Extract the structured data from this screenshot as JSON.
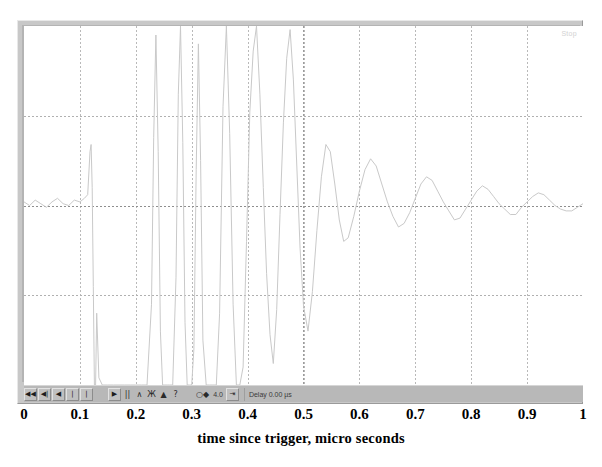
{
  "figure": {
    "instrument": "digital-storage-oscilloscope",
    "scope_readout": "Stop"
  },
  "toolbar": {
    "buttons": [
      {
        "name": "skip-back-button",
        "glyph": "◀◀",
        "style": "btn"
      },
      {
        "name": "step-back-button",
        "glyph": "◀|",
        "style": "btn"
      },
      {
        "name": "play-left-button",
        "glyph": "◀",
        "style": "btn"
      },
      {
        "name": "marker-a-button",
        "glyph": "|",
        "style": "btn"
      },
      {
        "name": "marker-b-button",
        "glyph": "|",
        "style": "btn"
      }
    ],
    "center_buttons": [
      {
        "name": "step-forward-button",
        "glyph": "▶",
        "style": "btn"
      },
      {
        "name": "pause-button",
        "glyph": "||",
        "style": "flat"
      },
      {
        "name": "rising-edge-icon",
        "glyph": "∧",
        "style": "flat"
      },
      {
        "name": "trigger-mode-icon",
        "glyph": "Ж",
        "style": "flat"
      },
      {
        "name": "trigger-level-icon",
        "glyph": "▲",
        "style": "flat"
      },
      {
        "name": "help-icon",
        "glyph": "?",
        "style": "flat"
      }
    ],
    "right_buttons": [
      {
        "name": "cursor-pair-icon",
        "glyph": "○◆",
        "style": "flat"
      }
    ],
    "scale_value": "4.0",
    "zoom-icon": "⇥",
    "delay_label": "Delay  0.00 µs"
  },
  "chart_data": {
    "type": "line",
    "title": "",
    "xlabel": "time since trigger, micro seconds",
    "ylabel": "",
    "xlim": [
      0,
      1
    ],
    "ylim": [
      -1,
      1
    ],
    "grid": true,
    "grid_divisions_x": 10,
    "grid_divisions_y": 4,
    "legend": "none",
    "xtick_labels": [
      "0",
      "0.1",
      "0.2",
      "0.3",
      "0.4",
      "0.5",
      "0.6",
      "0.7",
      "0.8",
      "0.9",
      "1"
    ],
    "xtick_values": [
      0,
      0.1,
      0.2,
      0.3,
      0.4,
      0.5,
      0.6,
      0.7,
      0.8,
      0.9,
      1.0
    ],
    "ytick_labels": [],
    "trace_color": "#c9c9c9",
    "series": [
      {
        "name": "channel-1-voltage",
        "description": "flat pre-trigger baseline, abrupt switching transient with full-scale excursions between 0.12 and 0.40 us, damped ringing 0.40-0.58 us, then decaying low-amplitude noise to 1.0 us",
        "x": [
          0.0,
          0.01,
          0.02,
          0.03,
          0.04,
          0.05,
          0.06,
          0.07,
          0.08,
          0.09,
          0.1,
          0.108,
          0.114,
          0.118,
          0.12,
          0.122,
          0.124,
          0.126,
          0.128,
          0.13,
          0.134,
          0.14,
          0.15,
          0.16,
          0.17,
          0.18,
          0.19,
          0.2,
          0.21,
          0.22,
          0.228,
          0.232,
          0.236,
          0.24,
          0.244,
          0.248,
          0.252,
          0.256,
          0.26,
          0.266,
          0.272,
          0.276,
          0.28,
          0.284,
          0.288,
          0.292,
          0.296,
          0.3,
          0.304,
          0.308,
          0.312,
          0.316,
          0.32,
          0.326,
          0.332,
          0.338,
          0.344,
          0.35,
          0.356,
          0.362,
          0.368,
          0.374,
          0.38,
          0.386,
          0.392,
          0.398,
          0.404,
          0.41,
          0.416,
          0.422,
          0.428,
          0.434,
          0.44,
          0.446,
          0.452,
          0.458,
          0.464,
          0.47,
          0.476,
          0.482,
          0.488,
          0.494,
          0.5,
          0.508,
          0.516,
          0.524,
          0.532,
          0.54,
          0.548,
          0.556,
          0.564,
          0.572,
          0.58,
          0.59,
          0.6,
          0.61,
          0.62,
          0.63,
          0.64,
          0.65,
          0.66,
          0.67,
          0.68,
          0.69,
          0.7,
          0.71,
          0.72,
          0.73,
          0.74,
          0.75,
          0.76,
          0.77,
          0.78,
          0.79,
          0.8,
          0.81,
          0.82,
          0.83,
          0.84,
          0.85,
          0.86,
          0.87,
          0.88,
          0.89,
          0.9,
          0.91,
          0.92,
          0.93,
          0.94,
          0.95,
          0.96,
          0.97,
          0.98,
          0.99,
          1.0
        ],
        "y": [
          0.02,
          0.0,
          0.03,
          0.01,
          -0.01,
          0.02,
          0.04,
          0.01,
          0.0,
          0.03,
          0.02,
          0.04,
          0.06,
          0.3,
          0.34,
          0.1,
          -0.45,
          -1.0,
          -1.0,
          -0.6,
          -0.96,
          -1.0,
          -1.0,
          -1.0,
          -1.0,
          -1.0,
          -1.0,
          -1.0,
          -1.0,
          -1.0,
          -0.55,
          0.38,
          0.95,
          0.3,
          -0.7,
          -1.0,
          -1.0,
          -1.0,
          -1.0,
          -1.0,
          -0.4,
          0.62,
          1.0,
          0.35,
          -0.65,
          -1.0,
          -1.0,
          -1.0,
          -0.8,
          0.2,
          0.9,
          0.25,
          -0.75,
          -1.0,
          -1.0,
          -1.0,
          -1.0,
          -0.6,
          0.55,
          1.0,
          0.4,
          -0.55,
          -1.0,
          -1.0,
          -0.9,
          -0.2,
          0.52,
          0.86,
          1.0,
          0.62,
          0.1,
          -0.38,
          -0.72,
          -0.88,
          -0.58,
          -0.05,
          0.46,
          0.82,
          0.98,
          0.7,
          0.22,
          -0.24,
          -0.56,
          -0.7,
          -0.48,
          -0.14,
          0.16,
          0.34,
          0.3,
          0.12,
          -0.08,
          -0.2,
          -0.18,
          -0.06,
          0.08,
          0.2,
          0.26,
          0.22,
          0.12,
          0.02,
          -0.06,
          -0.12,
          -0.1,
          -0.04,
          0.04,
          0.12,
          0.16,
          0.14,
          0.08,
          0.02,
          -0.03,
          -0.08,
          -0.07,
          -0.02,
          0.03,
          0.08,
          0.11,
          0.09,
          0.05,
          0.01,
          -0.02,
          -0.05,
          -0.05,
          -0.01,
          0.02,
          0.05,
          0.07,
          0.06,
          0.03,
          0.0,
          -0.02,
          -0.03,
          -0.03,
          -0.01,
          0.01
        ]
      }
    ]
  }
}
